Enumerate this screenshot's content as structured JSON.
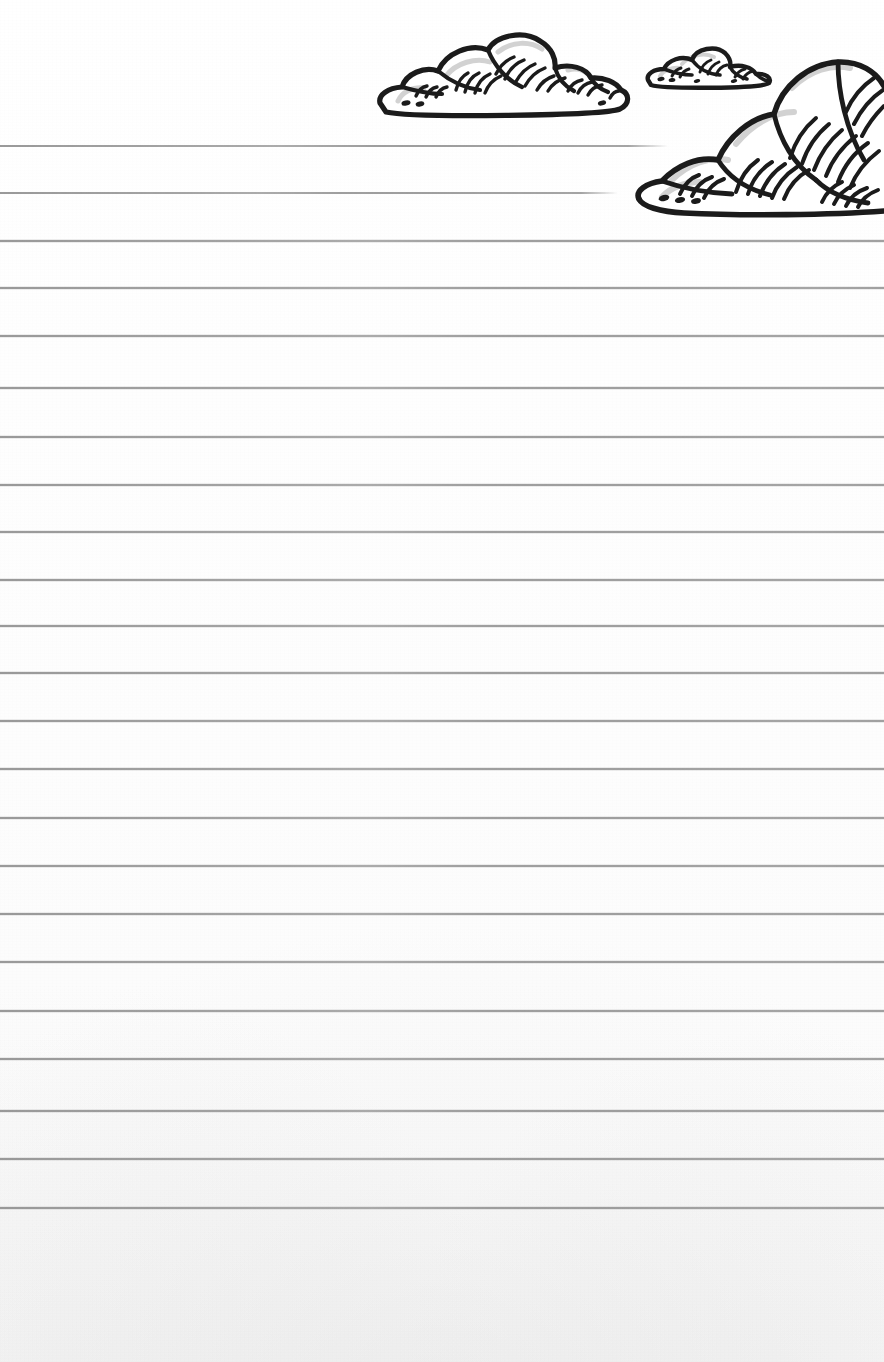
{
  "document": {
    "type": "lined-notepaper",
    "title": "Lined Notepaper with Clouds",
    "orientation": "portrait",
    "width_px": 884,
    "height_px": 1362,
    "paper_color": "#fdfdfd",
    "line_color": "#969696",
    "ink_color": "#1b1b1b",
    "shade_color": "#d2d2d2",
    "writing_area_text": "",
    "notes_placeholder": ""
  },
  "ruled_lines": {
    "count": 23,
    "first_line_y": 146,
    "spacing_px": 47.5,
    "line_thickness_px": 2,
    "left_margin_px": 0,
    "default_right_px": 884,
    "lines": [
      {
        "index": 1,
        "y": 146,
        "x_start": 0,
        "x_end": 668,
        "truncated": true
      },
      {
        "index": 2,
        "y": 193,
        "x_start": 0,
        "x_end": 618,
        "truncated": true
      },
      {
        "index": 3,
        "y": 241,
        "x_start": 0,
        "x_end": 884,
        "truncated": false
      },
      {
        "index": 4,
        "y": 288,
        "x_start": 0,
        "x_end": 884,
        "truncated": false
      },
      {
        "index": 5,
        "y": 336,
        "x_start": 0,
        "x_end": 884,
        "truncated": false
      },
      {
        "index": 6,
        "y": 388,
        "x_start": 0,
        "x_end": 884,
        "truncated": false
      },
      {
        "index": 7,
        "y": 437,
        "x_start": 0,
        "x_end": 884,
        "truncated": false
      },
      {
        "index": 8,
        "y": 485,
        "x_start": 0,
        "x_end": 884,
        "truncated": false
      },
      {
        "index": 9,
        "y": 532,
        "x_start": 0,
        "x_end": 884,
        "truncated": false
      },
      {
        "index": 10,
        "y": 580,
        "x_start": 0,
        "x_end": 884,
        "truncated": false
      },
      {
        "index": 11,
        "y": 626,
        "x_start": 0,
        "x_end": 884,
        "truncated": false
      },
      {
        "index": 12,
        "y": 673,
        "x_start": 0,
        "x_end": 884,
        "truncated": false
      },
      {
        "index": 13,
        "y": 721,
        "x_start": 0,
        "x_end": 884,
        "truncated": false
      },
      {
        "index": 14,
        "y": 769,
        "x_start": 0,
        "x_end": 884,
        "truncated": false
      },
      {
        "index": 15,
        "y": 818,
        "x_start": 0,
        "x_end": 884,
        "truncated": false
      },
      {
        "index": 16,
        "y": 866,
        "x_start": 0,
        "x_end": 884,
        "truncated": false
      },
      {
        "index": 17,
        "y": 914,
        "x_start": 0,
        "x_end": 884,
        "truncated": false
      },
      {
        "index": 18,
        "y": 962,
        "x_start": 0,
        "x_end": 884,
        "truncated": false
      },
      {
        "index": 19,
        "y": 1011,
        "x_start": 0,
        "x_end": 884,
        "truncated": false
      },
      {
        "index": 20,
        "y": 1059,
        "x_start": 0,
        "x_end": 884,
        "truncated": false
      },
      {
        "index": 21,
        "y": 1111,
        "x_start": 0,
        "x_end": 884,
        "truncated": false
      },
      {
        "index": 22,
        "y": 1159,
        "x_start": 0,
        "x_end": 884,
        "truncated": false
      },
      {
        "index": 23,
        "y": 1208,
        "x_start": 0,
        "x_end": 884,
        "truncated": false
      }
    ]
  },
  "illustrations": {
    "style": "hand-drawn ink, bold outline with curved hatch shading",
    "clouds": [
      {
        "name": "cloud-large-left",
        "label": "Large cloud (left)",
        "x": 372,
        "y": 30,
        "width": 262,
        "height": 92,
        "puff_count": 6,
        "clipped_by_edge": false
      },
      {
        "name": "cloud-small-center",
        "label": "Small cloud (center)",
        "x": 642,
        "y": 44,
        "width": 134,
        "height": 48,
        "puff_count": 4,
        "clipped_by_edge": false
      },
      {
        "name": "cloud-large-right",
        "label": "Large cloud (right, cropped at page edge)",
        "x": 632,
        "y": 52,
        "width": 252,
        "height": 168,
        "puff_count": 5,
        "clipped_by_edge": true
      }
    ]
  }
}
